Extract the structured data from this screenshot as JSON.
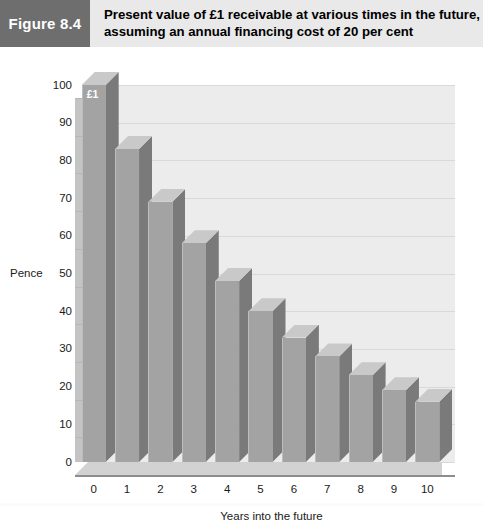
{
  "figure": {
    "badge_label": "Figure 8.4",
    "title_line_1": "Present value of £1 receivable at various times in the future,",
    "title_line_2": "assuming an annual financing cost of 20 per cent"
  },
  "colors": {
    "badge_background": "#6e6e6e",
    "header_background": "#e9e9e9",
    "plot_background": "#ececec",
    "bar_front": "#a3a3a3",
    "bar_side": "#7a7a7a",
    "bar_top": "#c9c9c9",
    "gridline": "#d9d9d9",
    "axis": "#8d8d8d",
    "text": "#1a1a1a"
  },
  "chart_data": {
    "type": "bar",
    "title": "Present value of £1 receivable at various times in the future, assuming an annual financing cost of 20 per cent",
    "xlabel": "Years into the future",
    "ylabel": "Pence",
    "categories": [
      "0",
      "1",
      "2",
      "3",
      "4",
      "5",
      "6",
      "7",
      "8",
      "9",
      "10"
    ],
    "values": [
      100,
      83,
      69,
      58,
      48,
      40,
      33,
      28,
      23,
      19,
      16
    ],
    "ylim": [
      0,
      100
    ],
    "ytick_labels": [
      "0",
      "10",
      "20",
      "30",
      "40",
      "50",
      "60",
      "70",
      "80",
      "90",
      "100"
    ],
    "ytick_values": [
      0,
      10,
      20,
      30,
      40,
      50,
      60,
      70,
      80,
      90,
      100
    ],
    "xtick_labels": [
      "0",
      "1",
      "2",
      "3",
      "4",
      "5",
      "6",
      "7",
      "8",
      "9",
      "10"
    ],
    "grid": true,
    "legend": "none",
    "annotations": [
      {
        "label": "£1",
        "category": "0",
        "value": 100
      }
    ]
  }
}
